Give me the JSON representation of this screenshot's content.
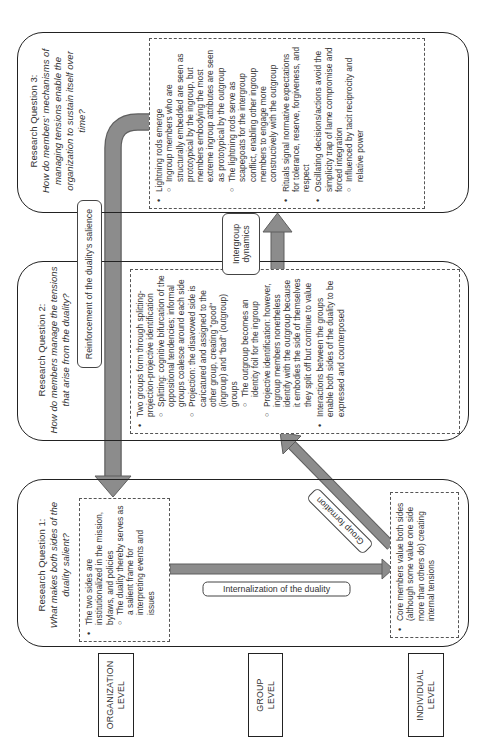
{
  "levels": {
    "organization": "ORGANIZATION LEVEL",
    "group": "GROUP LEVEL",
    "individual": "INDIVIDUAL LEVEL"
  },
  "rq1": {
    "title": "Research Question 1:",
    "question": "What makes both sides of the duality salient?",
    "organization_bullets": [
      {
        "text": "The two sides are institutionalized in the mission, bylaws, and policies",
        "sub": [
          "The duality thereby serves as a salient frame for interpreting events and issues"
        ]
      }
    ],
    "individual_bullets": [
      {
        "text": "Core members value both sides (although some value one side more than others do) creating internal tensions",
        "sub": []
      }
    ]
  },
  "rq2": {
    "title": "Research Question 2:",
    "question": "How do members manage the tensions that arise from the duality?",
    "bullets": [
      {
        "text": "Two groups form through splitting-projection-projective identification",
        "sub": [
          "Splitting: cognitive bifurcation of the oppositional tendencies; informal groups coalesce around each side",
          "Projection: the disavowed side is caricatured and assigned to the other group, creating \"good\" (ingroup) and \"bad\" (outgroup) groups",
          "The outgroup becomes an identity foil for the ingroup",
          "Projective identification: however, ingroup members nonetheless identify with the outgroup because it embodies the side of themselves they split off but continue to value"
        ]
      },
      {
        "text": "Interactions between the groups enable both sides of the duality to be expressed and counterposed",
        "sub": []
      }
    ]
  },
  "rq3": {
    "title": "Research Question 3:",
    "question": "How do members' mechanisms of managing tensions enable the organization to sustain itself over time?",
    "bullets": [
      {
        "text": "Lightning rods emerge",
        "sub": [
          "Ingroup members who are structurally embedded are seen as prototypical by the ingroup, but members embodying the most extreme ingroup attributes are seen as prototypical by the outgroup",
          "The lightning rods serve as scapegoats for the intergroup conflict, enabling other ingroup members to engage more constructively with the outgroup"
        ]
      },
      {
        "text": "Rituals signal normative expectations for tolerance, reserve, forgiveness, and respect",
        "sub": []
      },
      {
        "text": "Oscillating decisions/actions avoid the simplicity trap of lame compromise and forced integration",
        "sub": [
          "Influenced by tacit reciprocity and relative power"
        ]
      }
    ]
  },
  "arrows": {
    "reinforcement": "Reinforcement of the duality's salience",
    "intergroup": "Intergroup dynamics",
    "internalization": "Internalization of the duality",
    "group_formation": "Group formation"
  },
  "colors": {
    "arrow_fill": "#8a8a8a",
    "arrow_stroke": "#5a5a5a",
    "border": "#222222"
  }
}
